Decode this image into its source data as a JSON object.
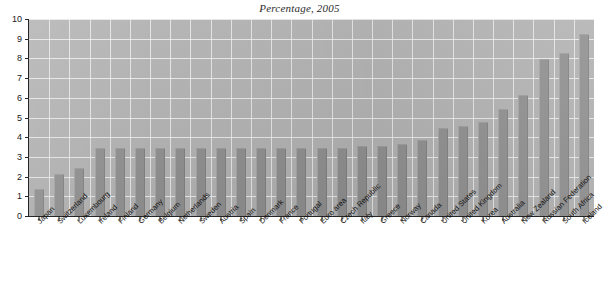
{
  "chart_data": {
    "type": "bar",
    "title": "Percentage, 2005",
    "xlabel": "",
    "ylabel": "",
    "ylim": [
      0,
      10
    ],
    "yticks": [
      0,
      1,
      2,
      3,
      4,
      5,
      6,
      7,
      8,
      9,
      10
    ],
    "grid": true,
    "legend": false,
    "categories": [
      "Japan",
      "Switzerland",
      "Luxembourg",
      "Ireland",
      "Finland",
      "Germany",
      "Belgium",
      "Netherlands",
      "Sweden",
      "Austria",
      "Spain",
      "Denmark",
      "France",
      "Portugal",
      "Euro area",
      "Czech Republic",
      "Italy",
      "Greece",
      "Norway",
      "Canada",
      "United States",
      "United Kingdom",
      "Korea",
      "Australia",
      "New Zealand",
      "Russian Federation",
      "South Africa",
      "Iceland"
    ],
    "values": [
      1.3,
      2.1,
      2.4,
      3.4,
      3.4,
      3.4,
      3.4,
      3.4,
      3.4,
      3.4,
      3.4,
      3.4,
      3.4,
      3.4,
      3.4,
      3.4,
      3.5,
      3.5,
      3.6,
      3.8,
      4.4,
      4.5,
      4.7,
      5.4,
      6.1,
      7.9,
      8.2,
      9.2
    ]
  },
  "axis": {
    "y_tick_labels": [
      "0",
      "1",
      "2",
      "3",
      "4",
      "5",
      "6",
      "7",
      "8",
      "9",
      "10"
    ]
  },
  "footer": {
    "scan_artifact": ""
  },
  "colors": {
    "bar_fill": "#8f8f8f",
    "plot_background": "#b2b2b2",
    "gridline": "#f0f0f0",
    "axis_line": "#262626",
    "text": "#111111"
  }
}
